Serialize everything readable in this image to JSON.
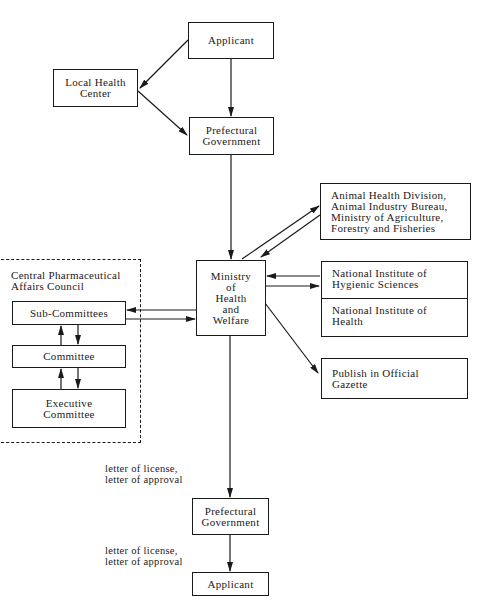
{
  "nodes": {
    "applicant_top": {
      "lines": [
        "Applicant"
      ]
    },
    "local_health_center": {
      "lines": [
        "Local Health",
        "Center"
      ]
    },
    "prefectural_top": {
      "lines": [
        "Prefectural",
        "Government"
      ]
    },
    "ministry": {
      "lines": [
        "Ministry",
        "of",
        "Health",
        "and",
        "Welfare"
      ]
    },
    "animal_health": {
      "lines": [
        "Animal Health Division,",
        "Animal Industry Bureau,",
        "Ministry of Agriculture,",
        "Forestry and Fisheries"
      ]
    },
    "national_institutes": {
      "hygienic": {
        "lines": [
          "National Institute of",
          "Hygienic Sciences"
        ]
      },
      "health": {
        "lines": [
          "National Institute of",
          "Health"
        ]
      }
    },
    "gazette": {
      "lines": [
        "Publish in Official",
        "Gazette"
      ]
    },
    "council": {
      "title": {
        "lines": [
          "Central Pharmaceutical",
          "Affairs Council"
        ]
      },
      "sub_committees": {
        "lines": [
          "Sub-Committees"
        ]
      },
      "committee": {
        "lines": [
          "Committee"
        ]
      },
      "executive_committee": {
        "lines": [
          "Executive",
          "Committee"
        ]
      }
    },
    "prefectural_bottom": {
      "lines": [
        "Prefectural",
        "Government"
      ]
    },
    "applicant_bottom": {
      "lines": [
        "Applicant"
      ]
    }
  },
  "edge_labels": {
    "ministry_to_prefectural": {
      "lines": [
        "letter of license,",
        "letter of approval"
      ]
    },
    "prefectural_to_applicant": {
      "lines": [
        "letter of license,",
        "letter of approval"
      ]
    }
  },
  "edges": [
    {
      "from": "Applicant",
      "to": "Local Health Center"
    },
    {
      "from": "Applicant",
      "to": "Prefectural Government"
    },
    {
      "from": "Local Health Center",
      "to": "Prefectural Government"
    },
    {
      "from": "Prefectural Government",
      "to": "Ministry of Health and Welfare"
    },
    {
      "from": "Ministry of Health and Welfare",
      "to": "Animal Health Division"
    },
    {
      "from": "Animal Health Division",
      "to": "Ministry of Health and Welfare"
    },
    {
      "from": "Ministry of Health and Welfare",
      "to": "National Institute of Hygienic Sciences"
    },
    {
      "from": "National Institute of Hygienic Sciences",
      "to": "Ministry of Health and Welfare"
    },
    {
      "from": "Ministry of Health and Welfare",
      "to": "Publish in Official Gazette"
    },
    {
      "from": "Ministry of Health and Welfare",
      "to": "Sub-Committees"
    },
    {
      "from": "Sub-Committees",
      "to": "Ministry of Health and Welfare"
    },
    {
      "from": "Sub-Committees",
      "to": "Committee"
    },
    {
      "from": "Committee",
      "to": "Sub-Committees"
    },
    {
      "from": "Committee",
      "to": "Executive Committee"
    },
    {
      "from": "Executive Committee",
      "to": "Committee"
    },
    {
      "from": "Ministry of Health and Welfare",
      "to": "Prefectural Government",
      "label": "letter of license, letter of approval"
    },
    {
      "from": "Prefectural Government",
      "to": "Applicant",
      "label": "letter of license, letter of approval"
    }
  ]
}
